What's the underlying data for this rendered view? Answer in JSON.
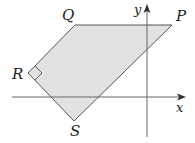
{
  "diagram": {
    "type": "coordinate-geometry",
    "axes": {
      "x_label": "x",
      "y_label": "y"
    },
    "shape": {
      "name": "quadrilateral PQRS",
      "fill": "#e2e2e2",
      "stroke": "#555555",
      "vertices": [
        {
          "label": "P",
          "px": [
            172,
            25
          ]
        },
        {
          "label": "Q",
          "px": [
            75,
            25
          ]
        },
        {
          "label": "R",
          "px": [
            28,
            73
          ]
        },
        {
          "label": "S",
          "px": [
            74,
            121
          ]
        }
      ],
      "right_angle_at": "R"
    },
    "labels": {
      "P": "P",
      "Q": "Q",
      "R": "R",
      "S": "S"
    }
  }
}
